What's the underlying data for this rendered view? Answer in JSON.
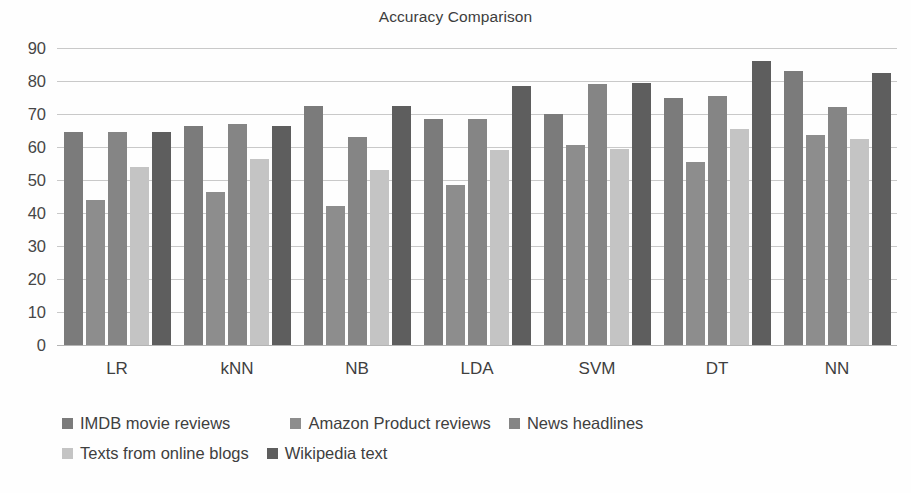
{
  "chart_data": {
    "type": "bar",
    "title": "Accuracy Comparison",
    "xlabel": "",
    "ylabel": "",
    "ylim": [
      0,
      90
    ],
    "yticks": [
      0,
      10,
      20,
      30,
      40,
      50,
      60,
      70,
      80,
      90
    ],
    "grid": true,
    "legend_position": "bottom-left",
    "categories": [
      "LR",
      "kNN",
      "NB",
      "LDA",
      "SVM",
      "DT",
      "NN"
    ],
    "series": [
      {
        "name": "IMDB movie reviews",
        "color": "#7b7b7b",
        "values": [
          64.5,
          66.5,
          72.5,
          68.5,
          70.0,
          75.0,
          83.0
        ]
      },
      {
        "name": "Amazon Product reviews",
        "color": "#8d8d8d",
        "values": [
          44.0,
          46.5,
          42.0,
          48.5,
          60.5,
          55.5,
          63.5
        ]
      },
      {
        "name": "News headlines",
        "color": "#858585",
        "values": [
          64.5,
          67.0,
          63.0,
          68.5,
          79.0,
          75.5,
          72.0
        ]
      },
      {
        "name": "Texts from online blogs",
        "color": "#c4c4c4",
        "values": [
          54.0,
          56.5,
          53.0,
          59.0,
          59.5,
          65.5,
          62.5
        ]
      },
      {
        "name": "Wikipedia text",
        "color": "#5e5e5e",
        "values": [
          64.5,
          66.5,
          72.5,
          78.5,
          79.5,
          86.0,
          82.5
        ]
      }
    ]
  }
}
